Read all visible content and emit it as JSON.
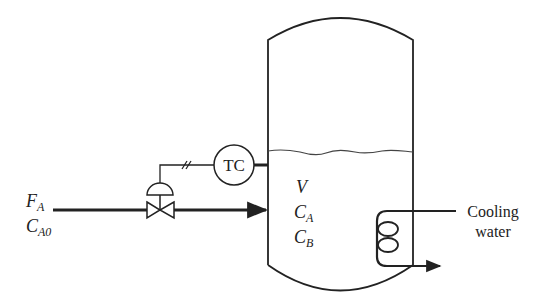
{
  "diagram": {
    "type": "process-flow",
    "feed": {
      "flow_label": "F",
      "flow_subscript": "A",
      "conc_label": "C",
      "conc_subscript": "A0"
    },
    "controller": {
      "label": "TC"
    },
    "vessel_variables": [
      {
        "symbol": "V",
        "subscript": ""
      },
      {
        "symbol": "C",
        "subscript": "A"
      },
      {
        "symbol": "C",
        "subscript": "B"
      }
    ],
    "cooling": {
      "line1": "Cooling",
      "line2": "water"
    }
  },
  "colors": {
    "line": "#222222",
    "background": "#ffffff"
  }
}
